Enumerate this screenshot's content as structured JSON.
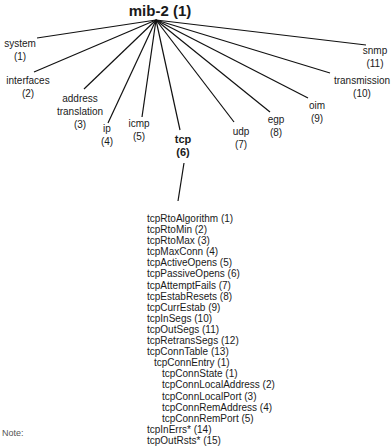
{
  "root": {
    "label": "mib-2 (1)"
  },
  "children": [
    {
      "name": "system",
      "num": "(1)"
    },
    {
      "name": "interfaces",
      "num": "(2)"
    },
    {
      "name": "address translation",
      "line1": "address",
      "line2": "translation",
      "num": "(3)"
    },
    {
      "name": "ip",
      "num": "(4)"
    },
    {
      "name": "icmp",
      "num": "(5)"
    },
    {
      "name": "tcp",
      "num": "(6)"
    },
    {
      "name": "udp",
      "num": "(7)"
    },
    {
      "name": "egp",
      "num": "(8)"
    },
    {
      "name": "oim",
      "num": "(9)"
    },
    {
      "name": "transmission",
      "num": "(10)"
    },
    {
      "name": "snmp",
      "num": "(11)"
    }
  ],
  "tcp_objects": [
    "tcpRtoAlgorithm (1)",
    "tcpRtoMin (2)",
    "tcpRtoMax (3)",
    "tcpMaxConn (4)",
    "tcpActiveOpens (5)",
    "tcpPassiveOpens (6)",
    "tcpAttemptFails (7)",
    "tcpEstabResets (8)",
    "tcpCurrEstab (9)",
    "tcpInSegs (10)",
    "tcpOutSegs (11)",
    "tcpRetransSegs (12)",
    "tcpConnTable (13)",
    "tcpConnEntry (1)",
    "tcpConnState (1)",
    "tcpConnLocalAddress (2)",
    "tcpConnLocalPort (3)",
    "tcpConnRemAddress (4)",
    "tcpConnRemPort (5)",
    "tcpInErrs* (14)",
    "tcpOutRsts* (15)"
  ],
  "note": "Note:"
}
